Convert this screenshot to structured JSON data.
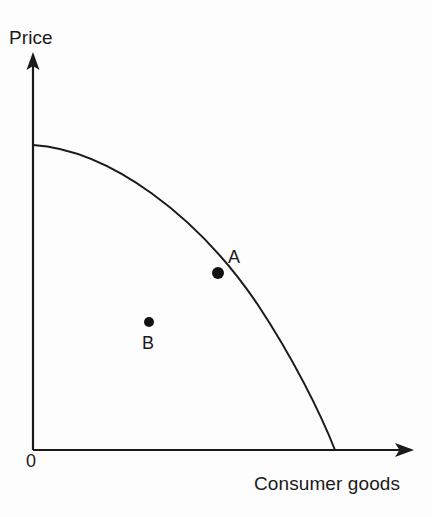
{
  "figure": {
    "background_color": "#fdfdfd",
    "ink_color": "#1a1a1a",
    "width": 432,
    "height": 517
  },
  "axes": {
    "y_axis_label": "Price",
    "x_axis_label": "Consumer goods",
    "origin_label": "0",
    "origin_px": {
      "x": 33,
      "y": 450
    },
    "y_axis_top_px": {
      "x": 33,
      "y": 54
    },
    "x_axis_right_px": {
      "x": 413,
      "y": 450
    },
    "arrowheads": [
      "y-axis-arrow",
      "x-axis-arrow"
    ],
    "ticks": [],
    "gridlines": false
  },
  "chart_data": {
    "type": "line",
    "title": "",
    "subtitle": "",
    "xlabel": "Consumer goods",
    "ylabel": "Price",
    "xlim": [
      0,
      1
    ],
    "ylim": [
      0,
      1
    ],
    "grid": false,
    "legend": null,
    "legend_position": "none",
    "series": [
      {
        "name": "Production possibility frontier",
        "type": "curve",
        "shape": "concave-to-origin",
        "x": [
          0.0,
          0.1,
          0.2,
          0.3,
          0.4,
          0.5,
          0.6,
          0.7,
          0.8,
          0.9,
          1.0
        ],
        "y": [
          1.0,
          0.995,
          0.978,
          0.949,
          0.904,
          0.841,
          0.756,
          0.641,
          0.483,
          0.269,
          0.0
        ],
        "x_intercept": 1.0,
        "y_intercept": 1.0,
        "path_px": "M 33 145 C 110 150, 198 216, 258 305 C 293 358, 320 412, 335 450"
      }
    ],
    "points": [
      {
        "label": "A",
        "x": 0.62,
        "y": 0.58,
        "px": {
          "x": 218,
          "y": 273
        },
        "radius_px": 6,
        "on_curve": true,
        "label_offset_px": {
          "x": 14,
          "y": -22
        },
        "description": "efficient point on the frontier"
      },
      {
        "label": "B",
        "x": 0.385,
        "y": 0.42,
        "px": {
          "x": 149,
          "y": 322
        },
        "radius_px": 5,
        "on_curve": false,
        "label_offset_px": {
          "x": 0,
          "y": 16
        },
        "description": "inefficient point inside the frontier"
      }
    ],
    "annotations": [
      {
        "text": "Price",
        "role": "y-axis-title"
      },
      {
        "text": "Consumer goods",
        "role": "x-axis-title"
      },
      {
        "text": "0",
        "role": "origin"
      },
      {
        "text": "A",
        "role": "point-label"
      },
      {
        "text": "B",
        "role": "point-label"
      }
    ]
  }
}
